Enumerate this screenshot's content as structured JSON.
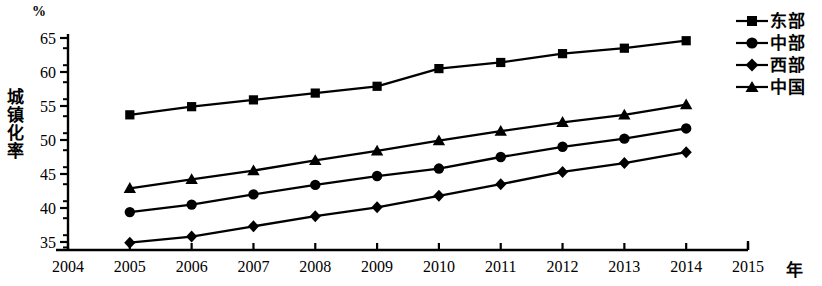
{
  "chart_data": {
    "type": "line",
    "title": "",
    "xlabel": "年",
    "ylabel": "城镇化率",
    "yunit": "%",
    "x": [
      2005,
      2006,
      2007,
      2008,
      2009,
      2010,
      2011,
      2012,
      2013,
      2014
    ],
    "xlim": [
      2004,
      2015
    ],
    "ylim": [
      33.2,
      65
    ],
    "xticks": [
      "2004",
      "2005",
      "2006",
      "2007",
      "2008",
      "2009",
      "2010",
      "2011",
      "2012",
      "2013",
      "2014",
      "2015"
    ],
    "yticks": [
      "35",
      "40",
      "45",
      "50",
      "55",
      "60",
      "65"
    ],
    "minor_ticks": true,
    "grid": false,
    "legend_position": "top-right",
    "series": [
      {
        "name": "东部",
        "marker": "square",
        "values": [
          53.7,
          54.9,
          55.9,
          56.9,
          57.9,
          60.5,
          61.4,
          62.7,
          63.5,
          64.6
        ]
      },
      {
        "name": "中部",
        "marker": "circle",
        "values": [
          39.4,
          40.5,
          42.0,
          43.4,
          44.7,
          45.8,
          47.5,
          49.0,
          50.2,
          51.7
        ]
      },
      {
        "name": "西部",
        "marker": "diamond",
        "values": [
          34.9,
          35.8,
          37.3,
          38.8,
          40.1,
          41.8,
          43.5,
          45.3,
          46.6,
          48.2
        ]
      },
      {
        "name": "中国",
        "marker": "triangle",
        "values": [
          42.9,
          44.2,
          45.5,
          47.0,
          48.4,
          49.9,
          51.3,
          52.6,
          53.7,
          55.2
        ]
      }
    ]
  },
  "axes": {
    "y_title_chars": [
      "城",
      "镇",
      "化",
      "率"
    ],
    "y_unit": "%",
    "x_unit": "年"
  }
}
